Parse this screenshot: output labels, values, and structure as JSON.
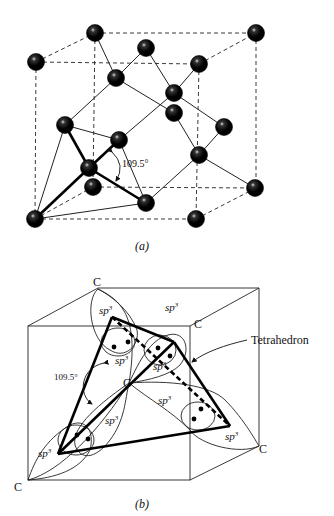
{
  "figure_a": {
    "caption": "(a)",
    "angle_label": "109.5°",
    "description": "Diamond cubic unit cell with tetrahedral bonding"
  },
  "figure_b": {
    "caption": "(b)",
    "angle_label": "109.5°",
    "atom_label": "C",
    "orbital_label": "sp",
    "orbital_superscript": "3",
    "callout_label": "Tetrahedron"
  }
}
